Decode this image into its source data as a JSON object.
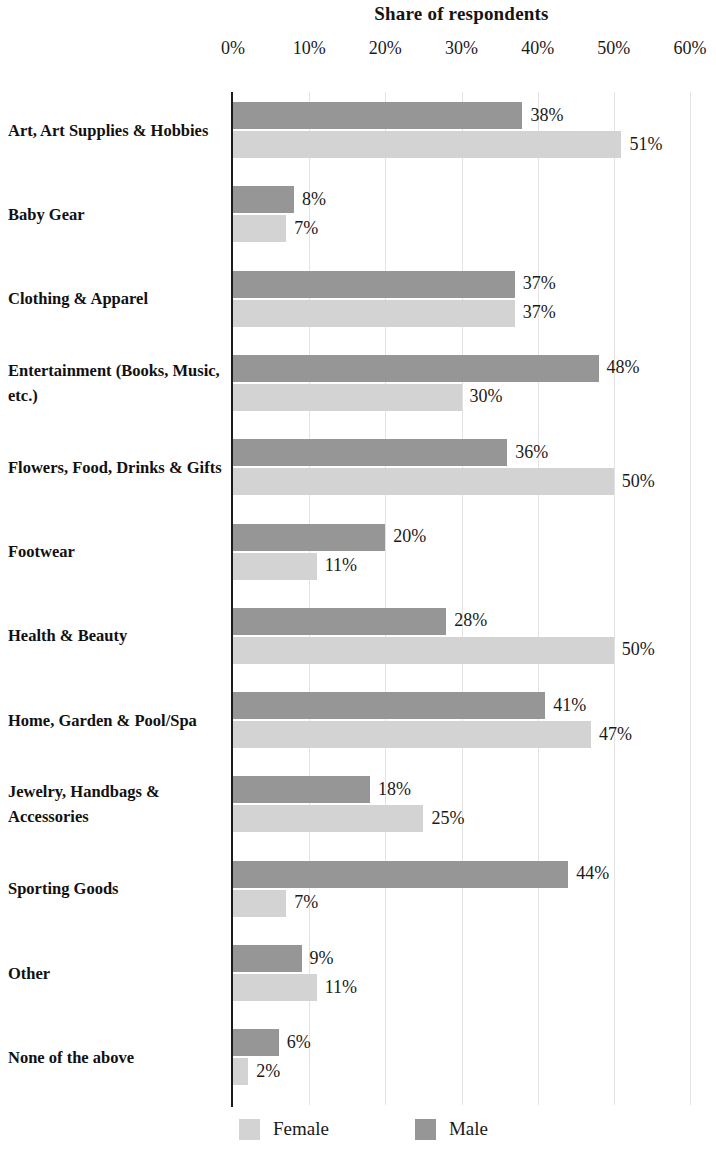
{
  "chart_data": {
    "type": "bar",
    "orientation": "horizontal",
    "title": "Share of respondents",
    "xlabel": "",
    "ylabel": "",
    "xlim": [
      0,
      60
    ],
    "xticks": [
      "0%",
      "10%",
      "20%",
      "30%",
      "40%",
      "50%",
      "60%"
    ],
    "xtick_values": [
      0,
      10,
      20,
      30,
      40,
      50,
      60
    ],
    "grid": true,
    "legend_position": "bottom",
    "categories": [
      "Art, Art Supplies & Hobbies",
      "Baby Gear",
      "Clothing & Apparel",
      "Entertainment (Books, Music, etc.)",
      "Flowers, Food, Drinks & Gifts",
      "Footwear",
      "Health & Beauty",
      "Home, Garden & Pool/Spa",
      "Jewelry, Handbags & Accessories",
      "Sporting Goods",
      "Other",
      "None of the above"
    ],
    "series": [
      {
        "name": "Male",
        "color": "#969696",
        "values": [
          38,
          8,
          37,
          48,
          36,
          20,
          28,
          41,
          18,
          44,
          9,
          6
        ],
        "labels": [
          "38%",
          "8%",
          "37%",
          "48%",
          "36%",
          "20%",
          "28%",
          "41%",
          "18%",
          "44%",
          "9%",
          "6%"
        ]
      },
      {
        "name": "Female",
        "color": "#d3d3d3",
        "values": [
          51,
          7,
          37,
          30,
          50,
          11,
          50,
          47,
          25,
          7,
          11,
          2
        ],
        "labels": [
          "51%",
          "7%",
          "37%",
          "30%",
          "50%",
          "11%",
          "50%",
          "47%",
          "25%",
          "7%",
          "11%",
          "2%"
        ]
      }
    ]
  },
  "legend": {
    "items": [
      {
        "label": "Female",
        "color": "#d3d3d3"
      },
      {
        "label": "Male",
        "color": "#969696"
      }
    ]
  }
}
